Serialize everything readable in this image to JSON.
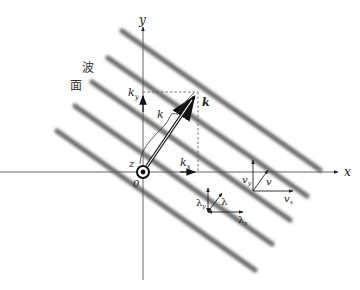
{
  "diagram": {
    "wavefront_label": [
      "波",
      "面"
    ],
    "axes": {
      "x_label": "x",
      "y_label": "y",
      "z_label": "z",
      "origin_label": "0"
    },
    "wave_vector": {
      "label": "k",
      "magnitude_label": "k",
      "kx_label": "k",
      "kx_sub": "x",
      "ky_label": "k",
      "ky_sub": "y"
    },
    "velocity": {
      "v_label": "v",
      "vx_label": "v",
      "vx_sub": "x",
      "vy_label": "v",
      "vy_sub": "y"
    },
    "wavelength": {
      "lambda_label": "λ",
      "lx_label": "λ",
      "lx_sub": "x",
      "ly_label": "λ",
      "ly_sub": "y"
    },
    "bands": [
      {
        "x1": 122,
        "y1": 31,
        "x2": 320,
        "y2": 170
      },
      {
        "x1": 108,
        "y1": 58,
        "x2": 307,
        "y2": 196
      },
      {
        "x1": 92,
        "y1": 82,
        "x2": 290,
        "y2": 220
      },
      {
        "x1": 75,
        "y1": 106,
        "x2": 272,
        "y2": 244
      },
      {
        "x1": 57,
        "y1": 131,
        "x2": 255,
        "y2": 270
      }
    ],
    "colors": {
      "band": "#6e6e6e",
      "axis": "#555555",
      "arrow": "#111111",
      "dash": "#555555"
    }
  }
}
